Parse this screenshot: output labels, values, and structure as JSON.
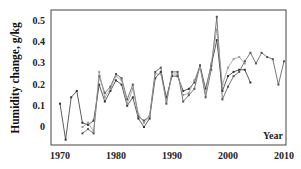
{
  "chart_data": {
    "type": "line",
    "title": "",
    "xlabel": "Year",
    "ylabel": "Humidity change, g/kg",
    "xlim": [
      1968,
      2011
    ],
    "ylim": [
      -0.08,
      0.55
    ],
    "xticks": [
      1970,
      1980,
      1990,
      2000,
      2010
    ],
    "yticks": [
      0,
      0.1,
      0.2,
      0.3,
      0.4,
      0.5
    ],
    "ytick_labels": [
      "0",
      "0.1",
      "0.2",
      "0.3",
      "0.4",
      "0.5"
    ],
    "grid": false,
    "legend": null,
    "series": [
      {
        "name": "series-1",
        "color": "#333333",
        "x": [
          1970,
          1971,
          1972,
          1973,
          1974,
          1975,
          1976,
          1977,
          1978,
          1979,
          1980,
          1981,
          1982,
          1983,
          1984,
          1985,
          1986,
          1987,
          1988,
          1989,
          1990,
          1991,
          1992,
          1993,
          1994,
          1995,
          1996,
          1997,
          1998,
          1999,
          2000,
          2001,
          2002,
          2003,
          2004
        ],
        "values": [
          0.11,
          -0.06,
          0.14,
          0.17,
          0.02,
          0.01,
          0.03,
          0.2,
          0.12,
          0.17,
          0.22,
          0.2,
          0.1,
          0.14,
          0.04,
          0.0,
          0.04,
          0.23,
          0.26,
          0.14,
          0.24,
          0.24,
          0.17,
          0.18,
          0.21,
          0.29,
          0.18,
          0.29,
          0.41,
          0.17,
          0.24,
          0.26,
          0.27,
          0.27,
          0.21
        ]
      },
      {
        "name": "series-2",
        "color": "#555555",
        "x": [
          1974,
          1975,
          1976,
          1977,
          1978,
          1979,
          1980,
          1981,
          1982,
          1983,
          1984,
          1985,
          1986,
          1987,
          1988,
          1989,
          1990,
          1991,
          1992,
          1993,
          1994,
          1995,
          1996,
          1997,
          1998,
          1999,
          2000,
          2001,
          2002,
          2003,
          2004,
          2005,
          2006,
          2007,
          2008,
          2009,
          2010
        ],
        "values": [
          -0.03,
          -0.01,
          -0.03,
          0.24,
          0.16,
          0.19,
          0.25,
          0.23,
          0.13,
          0.2,
          0.05,
          0.03,
          0.05,
          0.26,
          0.28,
          0.11,
          0.26,
          0.26,
          0.12,
          0.15,
          0.18,
          0.29,
          0.14,
          0.27,
          0.52,
          0.13,
          0.19,
          0.24,
          0.26,
          0.31,
          0.35,
          0.3,
          0.35,
          0.33,
          0.32,
          0.2,
          0.31
        ]
      },
      {
        "name": "series-3",
        "color": "#999999",
        "x": [
          1974,
          1975,
          1976,
          1977,
          1978,
          1979,
          1980,
          1981,
          1982,
          1983,
          1984,
          1985,
          1986,
          1987,
          1988,
          1989,
          1990,
          1991,
          1992,
          1993,
          1994,
          1995,
          1996,
          1997,
          1998,
          1999,
          2000,
          2001,
          2002,
          2003
        ],
        "values": [
          0.0,
          0.02,
          -0.02,
          0.26,
          0.14,
          0.18,
          0.24,
          0.22,
          0.11,
          0.18,
          0.06,
          0.02,
          0.05,
          0.25,
          0.25,
          0.12,
          0.25,
          0.25,
          0.15,
          0.16,
          0.22,
          0.28,
          0.16,
          0.3,
          0.46,
          0.2,
          0.28,
          0.32,
          0.33,
          0.3
        ]
      }
    ]
  }
}
